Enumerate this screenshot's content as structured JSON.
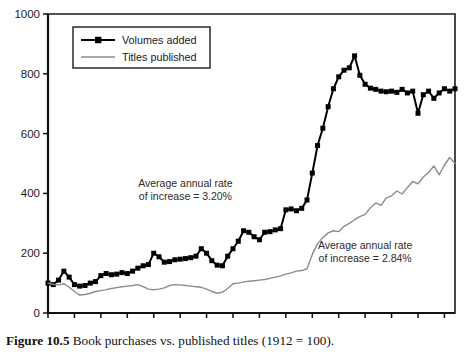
{
  "figure": {
    "caption_label": "Figure 10.5",
    "caption_text": "Book purchases vs. published titles (1912 = 100)."
  },
  "legend": {
    "position": "top-left-inside",
    "items": [
      {
        "label": "Volumes added",
        "color": "#000000",
        "marker": "square"
      },
      {
        "label": "Titles published",
        "color": "#8c8c8c",
        "marker": "none"
      }
    ]
  },
  "annotations": [
    {
      "line1": "Average annual rate",
      "line2": "of increase = 3.20%",
      "x": 1938,
      "y": 420
    },
    {
      "line1": "Average annual rate",
      "line2": "of increase = 2.84%",
      "x": 1972,
      "y": 215
    }
  ],
  "chart_data": {
    "type": "line",
    "title": "",
    "subtitle": "",
    "xlabel": "",
    "ylabel": "",
    "xlim": [
      1912,
      1989
    ],
    "ylim": [
      0,
      1000
    ],
    "yticks": [
      0,
      200,
      400,
      600,
      800,
      1000
    ],
    "ytick_labels": [
      "0",
      "200",
      "400",
      "600",
      "800",
      "1000"
    ],
    "xticks": [
      1912,
      1917,
      1922,
      1927,
      1932,
      1937,
      1942,
      1947,
      1952,
      1957,
      1962,
      1967,
      1972,
      1977,
      1982,
      1987
    ],
    "xtick_labels": [
      "1912",
      "17",
      "22",
      "27",
      "32",
      "37",
      "42",
      "47",
      "52",
      "57",
      "62",
      "67",
      "72",
      "77",
      "82",
      "87"
    ],
    "grid": false,
    "x": [
      1912,
      1913,
      1914,
      1915,
      1916,
      1917,
      1918,
      1919,
      1920,
      1921,
      1922,
      1923,
      1924,
      1925,
      1926,
      1927,
      1928,
      1929,
      1930,
      1931,
      1932,
      1933,
      1934,
      1935,
      1936,
      1937,
      1938,
      1939,
      1940,
      1941,
      1942,
      1943,
      1944,
      1945,
      1946,
      1947,
      1948,
      1949,
      1950,
      1951,
      1952,
      1953,
      1954,
      1955,
      1956,
      1957,
      1958,
      1959,
      1960,
      1961,
      1962,
      1963,
      1964,
      1965,
      1966,
      1967,
      1968,
      1969,
      1970,
      1971,
      1972,
      1973,
      1974,
      1975,
      1976,
      1977,
      1978,
      1979,
      1980,
      1981,
      1982,
      1983,
      1984,
      1985,
      1986,
      1987,
      1988,
      1989
    ],
    "series": [
      {
        "name": "Volumes added",
        "color": "#000000",
        "marker": "square",
        "values": [
          100,
          95,
          110,
          140,
          120,
          95,
          90,
          92,
          100,
          105,
          125,
          132,
          128,
          130,
          135,
          132,
          140,
          150,
          158,
          162,
          200,
          188,
          170,
          172,
          178,
          180,
          182,
          185,
          190,
          215,
          200,
          175,
          160,
          158,
          190,
          215,
          240,
          275,
          270,
          255,
          245,
          270,
          272,
          278,
          282,
          345,
          348,
          342,
          350,
          378,
          468,
          560,
          618,
          690,
          750,
          790,
          812,
          820,
          860,
          795,
          765,
          752,
          748,
          742,
          740,
          742,
          738,
          748,
          736,
          742,
          668,
          730,
          742,
          718,
          736,
          750,
          742,
          750
        ]
      },
      {
        "name": "Titles published",
        "color": "#8c8c8c",
        "marker": "none",
        "values": [
          100,
          96,
          94,
          98,
          86,
          72,
          60,
          62,
          66,
          72,
          75,
          78,
          82,
          85,
          88,
          90,
          92,
          95,
          88,
          80,
          78,
          80,
          84,
          92,
          95,
          94,
          92,
          90,
          88,
          86,
          80,
          72,
          66,
          70,
          82,
          98,
          100,
          104,
          106,
          108,
          110,
          112,
          116,
          120,
          124,
          130,
          134,
          140,
          142,
          148,
          196,
          232,
          252,
          268,
          275,
          272,
          290,
          300,
          312,
          322,
          330,
          352,
          368,
          360,
          385,
          392,
          408,
          398,
          420,
          440,
          432,
          455,
          470,
          492,
          462,
          495,
          520,
          500
        ]
      }
    ]
  }
}
